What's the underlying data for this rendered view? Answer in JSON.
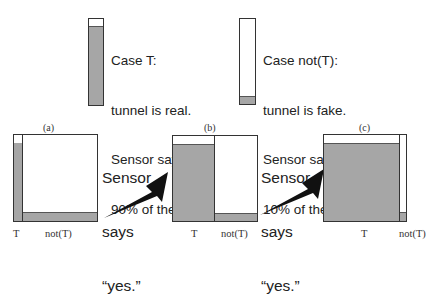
{
  "legend": {
    "case_t": {
      "lines": [
        "Case T:",
        "tunnel is real.",
        "Sensor says “yes”",
        "90% of the time."
      ],
      "yes_fraction": 0.9,
      "fill_color": "#a6a6a6"
    },
    "case_not_t": {
      "lines": [
        "Case not(T):",
        "tunnel is fake.",
        "Sensor says “yes”",
        "10% of the time."
      ],
      "yes_fraction": 0.1,
      "fill_color": "#a6a6a6"
    }
  },
  "panels": [
    {
      "label": "(a)",
      "t_label": "T",
      "not_t_label": "not(T)"
    },
    {
      "label": "(b)",
      "t_label": "T",
      "not_t_label": "not(T)"
    },
    {
      "label": "(c)",
      "t_label": "T",
      "not_t_label": "not(T)"
    }
  ],
  "transitions": [
    {
      "lines": [
        "Sensor",
        "says",
        "“yes.”"
      ],
      "icon": "arrow-icon"
    },
    {
      "lines": [
        "Sensor",
        "says",
        "“yes.”"
      ],
      "icon": "arrow-icon"
    }
  ]
}
